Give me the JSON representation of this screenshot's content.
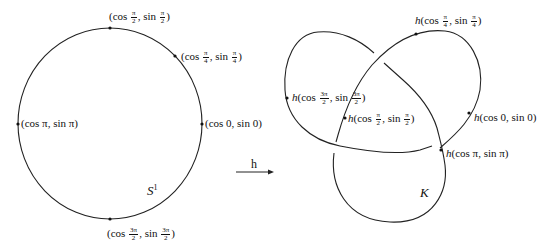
{
  "diagram": {
    "left": {
      "space_label": "S",
      "space_sup": "1",
      "points": [
        {
          "id": "p_pi_over_2",
          "fn": "(cos",
          "num": "π",
          "den": "2",
          "mid": ", sin",
          "num2": "π",
          "den2": "2",
          "end": ")"
        },
        {
          "id": "p_pi_over_4",
          "fn": "(cos",
          "num": "π",
          "den": "4",
          "mid": ", sin",
          "num2": "π",
          "den2": "4",
          "end": ")"
        },
        {
          "id": "p_pi",
          "text": "(cos π, sin π)"
        },
        {
          "id": "p_0",
          "text": "(cos 0, sin 0)"
        },
        {
          "id": "p_3pi_over_2",
          "fn": "(cos",
          "num": "3π",
          "den": "2",
          "mid": ", sin",
          "num2": "3π",
          "den2": "2",
          "end": ")"
        }
      ]
    },
    "map": {
      "label": "h"
    },
    "right": {
      "space_label": "K",
      "points": [
        {
          "id": "hp_pi_over_4",
          "h": "h",
          "fn": "(cos",
          "num": "π",
          "den": "4",
          "mid": ", sin",
          "num2": "π",
          "den2": "4",
          "end": ")"
        },
        {
          "id": "hp_3pi_over_2",
          "h": "h",
          "fn": "(cos",
          "num": "3π",
          "den": "2",
          "mid": ", sin",
          "num2": "3π",
          "den2": "2",
          "end": ")"
        },
        {
          "id": "hp_pi_over_2",
          "h": "h",
          "fn": "(cos",
          "num": "π",
          "den": "2",
          "mid": ", sin",
          "num2": "π",
          "den2": "2",
          "end": ")"
        },
        {
          "id": "hp_0",
          "h": "h",
          "text": "(cos 0, sin 0)"
        },
        {
          "id": "hp_pi",
          "h": "h",
          "text": "(cos π, sin π)"
        }
      ]
    }
  }
}
